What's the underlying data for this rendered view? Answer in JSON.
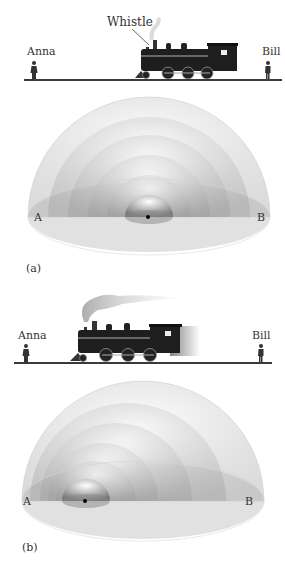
{
  "panel_a": {
    "caption": "(a)",
    "observer_left": "Anna",
    "observer_right": "Bill",
    "callout": "Whistle",
    "point_left": "A",
    "point_right": "B",
    "state": "train stationary, wavefronts concentric"
  },
  "panel_b": {
    "caption": "(b)",
    "observer_left": "Anna",
    "observer_right": "Bill",
    "point_left": "A",
    "point_right": "B",
    "state": "train moving left, wavefronts bunched toward A"
  },
  "colors": {
    "ground": "#3a3a3a",
    "shell": "#bdbdbd",
    "train": "#1e1e1e",
    "text": "#333333"
  }
}
